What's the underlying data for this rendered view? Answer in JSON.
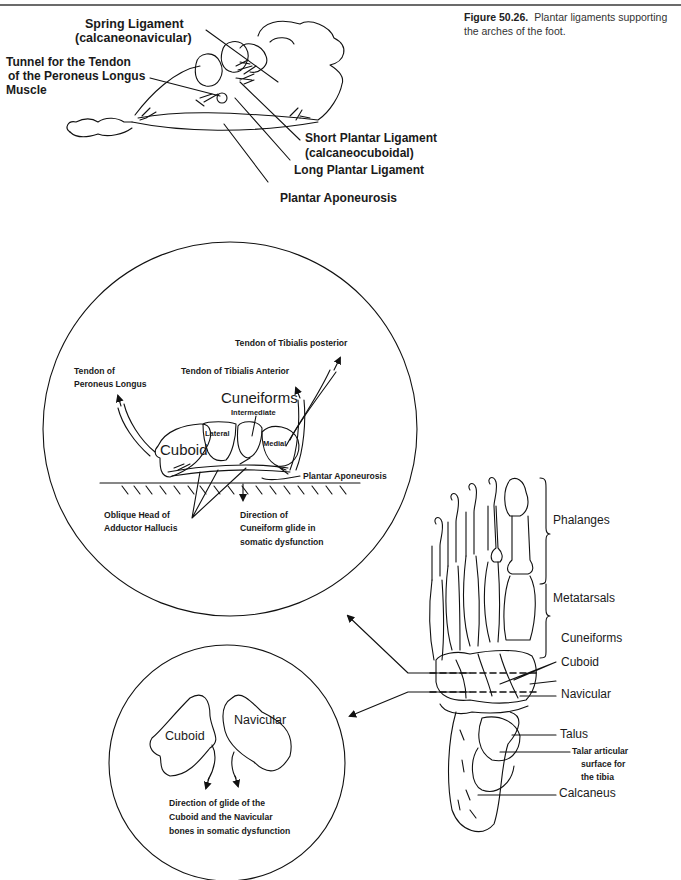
{
  "page": {
    "header_rule": true
  },
  "caption": {
    "figure_number": "Figure 50.26.",
    "text": "Plantar ligaments supporting the arches of the foot."
  },
  "top_figure": {
    "labels": {
      "spring_ligament": "Spring Ligament",
      "spring_ligament_sub": "(calcaneonavicular)",
      "tunnel_line1": "Tunnel for the Tendon",
      "tunnel_line2": "of the Peroneus Longus",
      "tunnel_line3": "Muscle",
      "short_plantar": "Short Plantar Ligament",
      "short_plantar_sub": "(calcaneocuboidal)",
      "long_plantar": "Long Plantar Ligament",
      "plantar_aponeurosis": "Plantar Aponeurosis"
    }
  },
  "large_circle": {
    "labels": {
      "tibialis_posterior": "Tendon of Tibialis posterior",
      "tibialis_anterior": "Tendon of Tibialis Anterior",
      "peroneus_line1": "Tendon of",
      "peroneus_line2": "Peroneus Longus",
      "cuneiforms": "Cuneiforms",
      "intermediate": "Intermediate",
      "lateral": "Lateral",
      "medial": "Medial",
      "cuboid": "Cuboid",
      "plantar_aponeurosis": "Plantar Aponeurosis",
      "oblique_line1": "Oblique Head of",
      "oblique_line2": "Adductor Hallucis",
      "direction_line1": "Direction of",
      "direction_line2": "Cuneiform glide in",
      "direction_line3": "somatic dysfunction"
    }
  },
  "small_circle": {
    "labels": {
      "cuboid": "Cuboid",
      "navicular": "Navicular",
      "caption_line1": "Direction of glide of the",
      "caption_line2": "Cuboid and the Navicular",
      "caption_line3": "bones in somatic dysfunction"
    }
  },
  "foot_skeleton": {
    "labels": {
      "phalanges": "Phalanges",
      "metatarsals": "Metatarsals",
      "cuneiforms": "Cuneiforms",
      "cuboid": "Cuboid",
      "navicular": "Navicular",
      "talus": "Talus",
      "talar_line1": "Talar articular",
      "talar_line2": "surface for",
      "talar_line3": "the tibia",
      "calcaneus": "Calcaneus"
    }
  }
}
